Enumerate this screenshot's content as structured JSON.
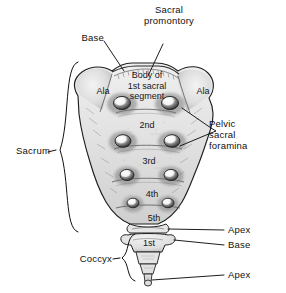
{
  "figure": {
    "style": "pencil-shaded anatomical line drawing",
    "background": "#ffffff",
    "ink": "#1a1a1a"
  },
  "labels": {
    "sacral_promontory": "Sacral\npromontory",
    "base_top": "Base",
    "ala_left": "Ala",
    "ala_right": "Ala",
    "body_first_segment": "Body of\n1st sacral\nsegment",
    "sacrum": "Sacrum",
    "pelvic_sacral_foramina": "Pelvic\nsacral\nforamina",
    "apex_sacrum": "Apex",
    "base_coccyx": "Base",
    "coccyx": "Coccyx",
    "apex_coccyx": "Apex"
  },
  "segment_numbers": {
    "sacral": [
      "2nd",
      "3rd",
      "4th",
      "5th"
    ],
    "coccygeal": [
      "1st"
    ]
  },
  "foramina": {
    "rows": 4,
    "per_row": 2,
    "total": 8
  },
  "leaders": {
    "pelvic_sacral_foramina_branches": 2,
    "braces": [
      "sacrum",
      "coccyx"
    ]
  }
}
